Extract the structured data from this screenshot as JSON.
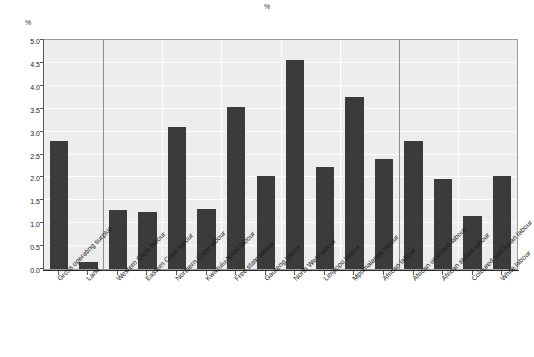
{
  "chart_data": {
    "type": "bar",
    "title": "%",
    "xlabel": "",
    "ylabel": "%",
    "ylim": [
      0.0,
      5.0
    ],
    "ytick_labels": [
      "0.0",
      "0.5",
      "1.0",
      "1.5",
      "2.0",
      "2.5",
      "3.0",
      "3.5",
      "4.0",
      "4.5",
      "5.0"
    ],
    "ytick_values": [
      0.0,
      0.5,
      1.0,
      1.5,
      2.0,
      2.5,
      3.0,
      3.5,
      4.0,
      4.5,
      5.0
    ],
    "grid": true,
    "legend": "none",
    "bar_color": "#3b3b3b",
    "plot_background": "#ededed",
    "gridline_color": "#ffffff",
    "group_separators": [
      2,
      12
    ],
    "categories": [
      "Gross operating surplus",
      "Land",
      "Western Cape labour",
      "Eastern Cape labour",
      "Northern Cape labour",
      "Kwazulu-Natal labour",
      "Free state labour",
      "Gauteng labour",
      "North West labour",
      "Limpopo labour",
      "Mpumalanga labour",
      "African labour",
      "African unskilled labour",
      "African skilled labour",
      "Coloured and Asian labour",
      "White labour"
    ],
    "values": [
      2.8,
      0.15,
      1.29,
      1.24,
      3.1,
      1.31,
      3.53,
      2.03,
      4.56,
      2.22,
      3.75,
      2.41,
      2.79,
      1.97,
      1.15,
      2.04
    ]
  }
}
